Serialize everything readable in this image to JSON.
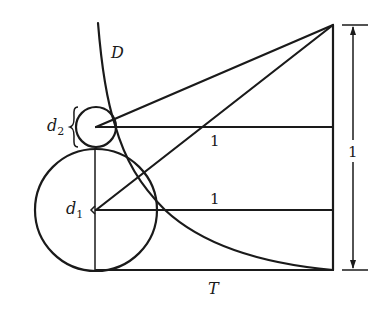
{
  "diagram": {
    "type": "geometric-construction",
    "labels": {
      "curve": "D",
      "small_circle_diameter": "d",
      "small_circle_sub": "2",
      "large_circle_diameter": "d",
      "large_circle_sub": "1",
      "upper_segment": "1",
      "lower_segment": "1",
      "height_dimension": "1",
      "base": "T"
    },
    "elements": {
      "apex": {
        "x": 333,
        "y": 25
      },
      "small_circle": {
        "cx": 96,
        "cy": 127,
        "r": 20
      },
      "large_circle": {
        "cx": 96,
        "cy": 210,
        "r": 61
      },
      "base_line_y": 270,
      "right_edge_x": 333,
      "dimension_x": 353
    },
    "colors": {
      "ink": "#1a1a1a",
      "background": "#ffffff"
    }
  }
}
